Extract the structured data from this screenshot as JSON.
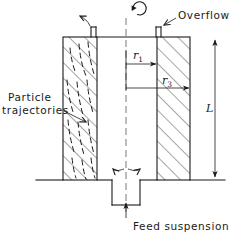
{
  "figure": {
    "type": "engineering-schematic",
    "background_color": "#ffffff",
    "line_color": "#1a1a1a",
    "centerline_color": "#555555"
  },
  "labels": {
    "overflow": "Overflow",
    "particle_line1": "Particle",
    "particle_line2": "trajectories",
    "feed": "Feed suspension",
    "length_symbol": "L",
    "radius_inner_symbol": "r",
    "radius_inner_subscript": "1",
    "radius_outer_symbol": "r",
    "radius_outer_subscript": "3"
  },
  "annotations": {
    "rotation_icon": "rotation-arrow-icon",
    "overflow_arrow_left": "overflow-flow-arrow-left",
    "overflow_arrow_right": "overflow-leader-arrow",
    "feed_split_arrow_left": "feed-split-arrow-left",
    "feed_split_arrow_right": "feed-split-arrow-right",
    "feed_inlet_arrow": "feed-inlet-arrow-up",
    "dimension_L": "length-dimension-arrow",
    "dimension_r1": "inner-radius-dimension-arrow",
    "dimension_r3": "outer-radius-dimension-arrow"
  },
  "geometry": {
    "bowl_top_y": 37,
    "bowl_bottom_y": 180,
    "bowl_left_x": 63,
    "bowl_right_x": 190,
    "annulus_left_inner_x": 97,
    "annulus_right_inner_x": 157,
    "centerline_x": 126,
    "feed_tube_left_x": 112,
    "feed_tube_right_x": 140,
    "feed_tube_bottom_y": 205
  }
}
